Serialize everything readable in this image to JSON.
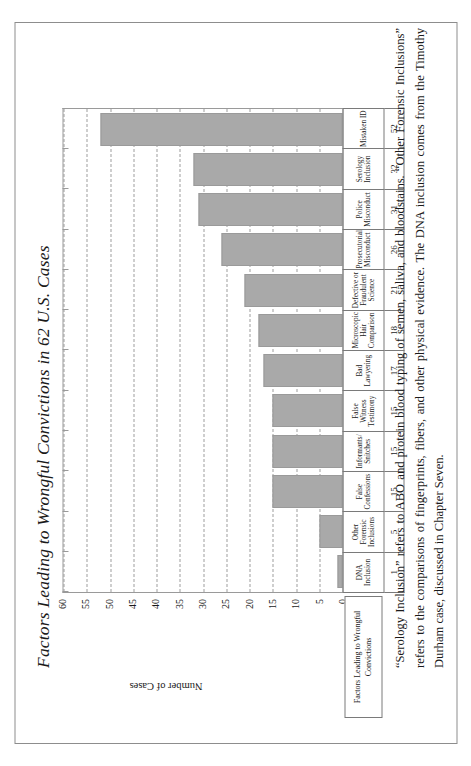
{
  "figure": {
    "title": "Factors Leading to Wrongful Convictions in 62 U.S. Cases",
    "legend_tag": "Factors Leading to Wrongful Convictions",
    "caption": "“Serology Inclusion” refers to ABO and protein blood typing of semen, saliva, and bloodstains. “Other Forensic Inclusions” refers to the comparisons of fingerprints, fibers, and other physical evidence. The DNA inclusion comes from the Timothy Durham case, discussed in Chapter Seven.",
    "bar_color": "#a9a9a9",
    "grid_color": "#9d9d9d",
    "axis_color": "#9a9a9a"
  },
  "chart_data": {
    "type": "bar",
    "title": "Factors Leading to Wrongful Convictions in 62 U.S. Cases",
    "xlabel": "Factors Leading to Wrongful Convictions",
    "ylabel": "Number of Cases",
    "ylim": [
      0,
      60
    ],
    "ytick_step": 5,
    "yticks": [
      60,
      55,
      50,
      45,
      40,
      35,
      30,
      25,
      20,
      15,
      10,
      5,
      0
    ],
    "grid": true,
    "grid_style": "dashed-horizontal",
    "legend": "none",
    "categories": [
      "DNA Inclusion",
      "Other Forensic Inclusions",
      "False Confessions",
      "Informants/ Snitches",
      "False Witness Testimony",
      "Bad Lawyering",
      "Microscopic Hair Comparison",
      "Defective or Fraudulent Science",
      "Prosecutorial Misconduct",
      "Police Misconduct",
      "Serology Inclusion",
      "Mistaken ID"
    ],
    "values": [
      1,
      5,
      15,
      15,
      15,
      17,
      18,
      21,
      26,
      31,
      32,
      52
    ]
  }
}
